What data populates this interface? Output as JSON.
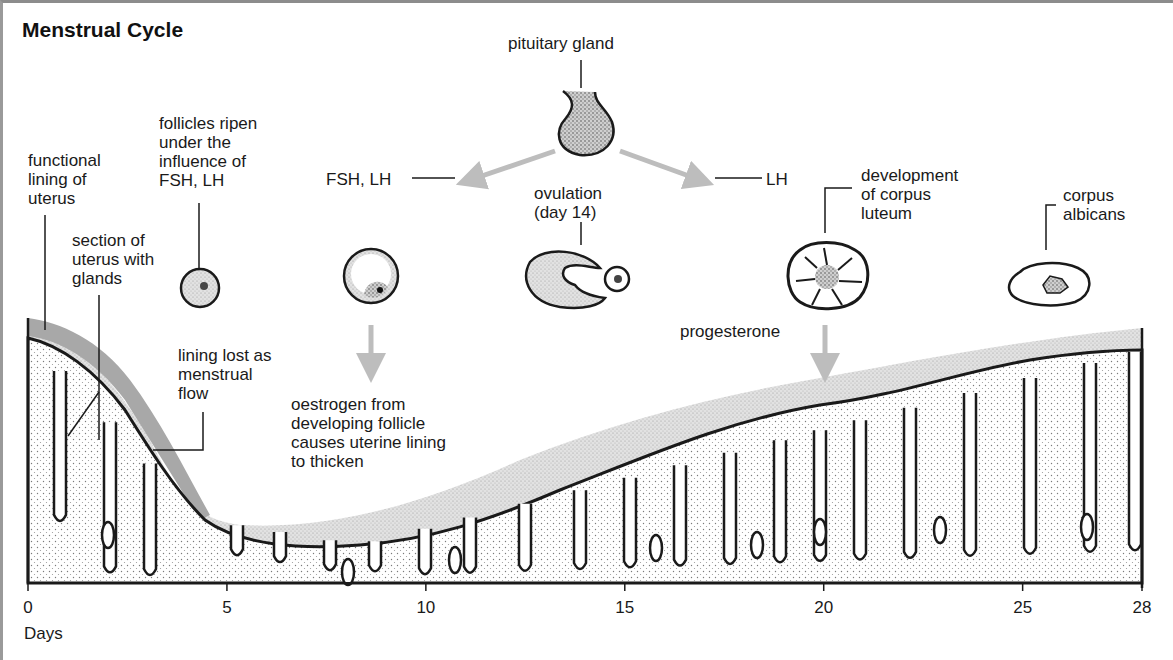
{
  "title": "Menstrual Cycle",
  "labels": {
    "pituitary_gland": "pituitary gland",
    "fsh_lh": "FSH, LH",
    "lh": "LH",
    "follicles_ripen": "follicles ripen\nunder the\ninfluence of\nFSH, LH",
    "functional_lining": "functional\nlining of\nuterus",
    "section_of_uterus": "section of\nuterus with\nglands",
    "ovulation": "ovulation\n(day 14)",
    "corpus_luteum": "development\nof corpus\nluteum",
    "corpus_albicans": "corpus\nalbicans",
    "progesterone": "progesterone",
    "lining_lost": "lining lost as\nmenstrual\nflow",
    "oestrogen": "oestrogen from\ndeveloping follicle\ncauses uterine lining\nto thicken"
  },
  "axis": {
    "label": "Days",
    "ticks": [
      "0",
      "5",
      "10",
      "15",
      "20",
      "25",
      "28"
    ],
    "min_day": 0,
    "max_day": 28
  },
  "stages": [
    {
      "name": "ripening-follicle",
      "day": 4
    },
    {
      "name": "developing-follicle",
      "day": 8.5
    },
    {
      "name": "ovulation",
      "day": 14
    },
    {
      "name": "corpus-luteum",
      "day": 20
    },
    {
      "name": "corpus-albicans",
      "day": 26
    }
  ],
  "colors": {
    "ink": "#1a1a1a",
    "arrow": "#bdbdbd",
    "shed_lining": "#a8a8a8",
    "lining_stipple": "#d9d9d9",
    "frame": "#8c8c8c"
  }
}
